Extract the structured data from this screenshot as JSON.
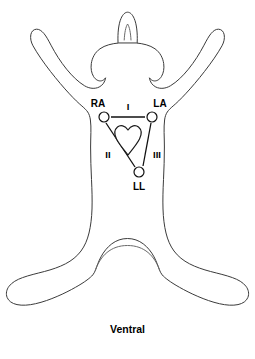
{
  "diagram": {
    "orientation_label": "Ventral",
    "subject_outline": "dog-body-ventral-view",
    "colors": {
      "background": "#ffffff",
      "outline_stroke": "#3b3b3b",
      "lead_stroke": "#111111",
      "label_text": "#000000",
      "heart_stroke": "#1a1a1a"
    },
    "electrodes": [
      {
        "id": "RA",
        "label": "RA",
        "name": "right-arm-electrode",
        "cx": 104,
        "cy": 117,
        "r": 5,
        "label_x": 98,
        "label_y": 107
      },
      {
        "id": "LA",
        "label": "LA",
        "name": "left-arm-electrode",
        "cx": 152,
        "cy": 117,
        "r": 5,
        "label_x": 160,
        "label_y": 107
      },
      {
        "id": "LL",
        "label": "LL",
        "name": "left-leg-electrode",
        "cx": 139,
        "cy": 172,
        "r": 5,
        "label_x": 139,
        "label_y": 190
      }
    ],
    "leads": [
      {
        "id": "I",
        "label": "I",
        "name": "lead-one",
        "from": "RA",
        "to": "LA",
        "x1": 111,
        "y1": 117,
        "x2": 145,
        "y2": 117,
        "label_x": 128,
        "label_y": 109
      },
      {
        "id": "II",
        "label": "II",
        "name": "lead-two",
        "from": "RA",
        "to": "LL",
        "x1": 106,
        "y1": 123,
        "x2": 135,
        "y2": 167,
        "label_x": 108,
        "label_y": 155
      },
      {
        "id": "III",
        "label": "III",
        "name": "lead-three",
        "from": "LA",
        "to": "LL",
        "x1": 151,
        "y1": 123,
        "x2": 143,
        "y2": 166,
        "label_x": 155,
        "label_y": 155
      }
    ],
    "heart": {
      "name": "heart-symbol",
      "center_x": 128,
      "center_y": 140
    }
  }
}
